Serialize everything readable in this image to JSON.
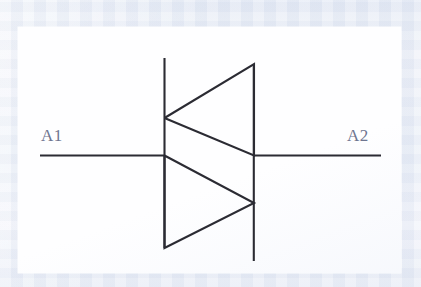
{
  "figure": {
    "kind": "schematic-symbol",
    "background_color": "#e9edf6",
    "paper_color": "#fefeff",
    "line_color": "#2b2b33",
    "label_color": "#6e7590",
    "terminals": [
      {
        "id": "A1",
        "label": "A1",
        "side": "left"
      },
      {
        "id": "A2",
        "label": "A2",
        "side": "right"
      }
    ],
    "geometry": {
      "lead_left": {
        "x1": 40,
        "y1": 155,
        "x2": 164,
        "y2": 155
      },
      "lead_right": {
        "x1": 254,
        "y1": 155,
        "x2": 381,
        "y2": 155
      },
      "bar_left": {
        "x1": 164,
        "y1": 58,
        "x2": 164,
        "y2": 248
      },
      "bar_right": {
        "x1": 254,
        "y1": 64,
        "x2": 254,
        "y2": 261
      },
      "triangle_upper": "164,118 254,64 254,155",
      "triangle_lower": "164,155 254,203 164,248"
    }
  }
}
